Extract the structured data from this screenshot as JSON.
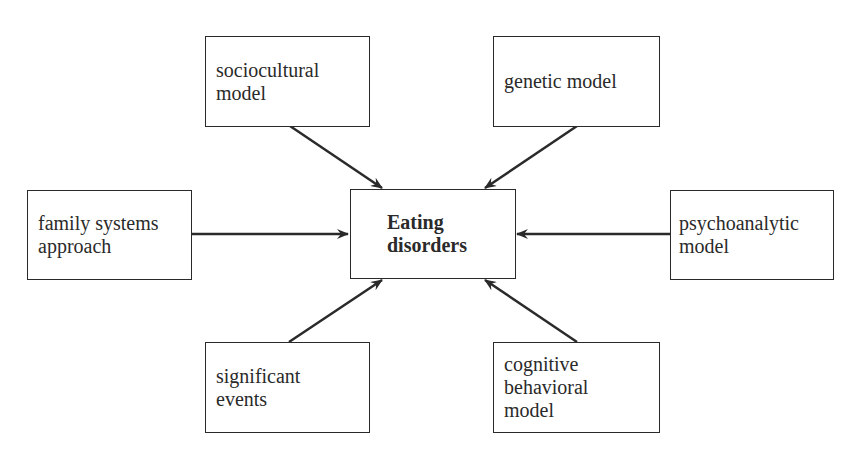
{
  "diagram": {
    "center": {
      "lines": [
        "Eating",
        "disorders"
      ]
    },
    "nodes": [
      {
        "id": "sociocultural",
        "lines": [
          "sociocultural",
          "model"
        ]
      },
      {
        "id": "genetic",
        "lines": [
          "genetic model"
        ]
      },
      {
        "id": "family-systems",
        "lines": [
          "family systems",
          "approach"
        ]
      },
      {
        "id": "psychoanalytic",
        "lines": [
          "psychoanalytic",
          "model"
        ]
      },
      {
        "id": "significant-events",
        "lines": [
          "significant",
          "events"
        ]
      },
      {
        "id": "cognitive-behavioral",
        "lines": [
          "cognitive",
          "behavioral",
          "model"
        ]
      }
    ],
    "edges": [
      {
        "from": "sociocultural",
        "to": "center"
      },
      {
        "from": "genetic",
        "to": "center"
      },
      {
        "from": "family-systems",
        "to": "center"
      },
      {
        "from": "psychoanalytic",
        "to": "center"
      },
      {
        "from": "significant-events",
        "to": "center"
      },
      {
        "from": "cognitive-behavioral",
        "to": "center"
      }
    ],
    "colors": {
      "stroke": "#2a2a2a",
      "background": "#ffffff"
    }
  }
}
